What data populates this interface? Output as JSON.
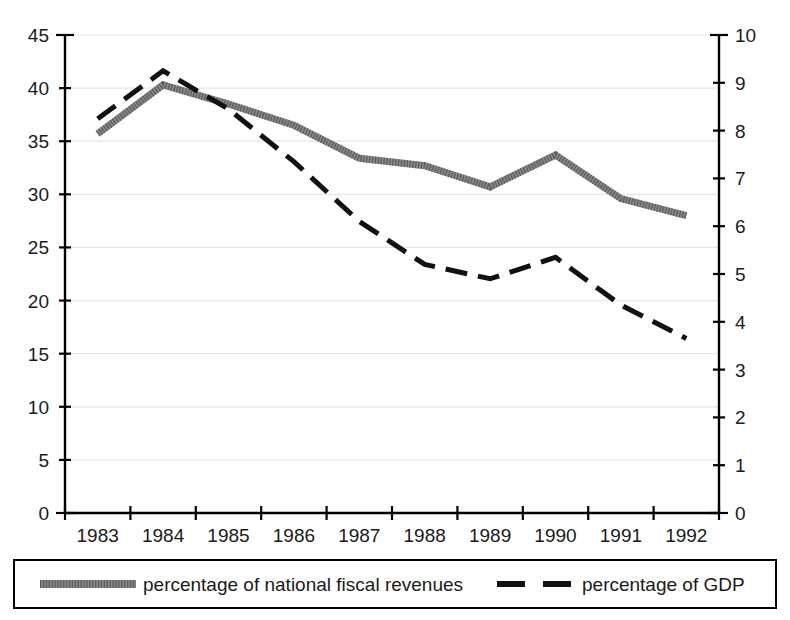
{
  "chart_data": {
    "type": "line",
    "title": "",
    "subtitle": "",
    "xlabel": "",
    "ylabel": "",
    "grid": true,
    "legend_position": "bottom",
    "categories": [
      "1983",
      "1984",
      "1985",
      "1986",
      "1987",
      "1988",
      "1989",
      "1990",
      "1991",
      "1992"
    ],
    "x_tick_labels": [
      "1983",
      "1984",
      "1985",
      "1986",
      "1987",
      "1988",
      "1989",
      "1990",
      "1991",
      "1992"
    ],
    "left_axis": {
      "label": "",
      "ylim": [
        0,
        45
      ],
      "tick_step": 5,
      "ticks": [
        0,
        5,
        10,
        15,
        20,
        25,
        30,
        35,
        40,
        45
      ],
      "tick_labels": [
        "0",
        "5",
        "10",
        "15",
        "20",
        "25",
        "30",
        "35",
        "40",
        "45"
      ]
    },
    "right_axis": {
      "label": "",
      "ylim": [
        0,
        10
      ],
      "tick_step": 1,
      "ticks": [
        0,
        1,
        2,
        3,
        4,
        5,
        6,
        7,
        8,
        9,
        10
      ],
      "tick_labels": [
        "0",
        "1",
        "2",
        "3",
        "4",
        "5",
        "6",
        "7",
        "8",
        "9",
        "10"
      ]
    },
    "series": [
      {
        "name": "percentage of national fiscal revenues",
        "axis": "left",
        "style": "solid-thick-gray",
        "color": "#8a8a8a",
        "values": [
          35.7,
          40.3,
          38.5,
          36.5,
          33.4,
          32.7,
          30.7,
          33.7,
          29.6,
          28.0
        ]
      },
      {
        "name": "percentage of GDP",
        "axis": "right",
        "style": "dashed-black",
        "color": "#111111",
        "values": [
          8.25,
          9.25,
          8.45,
          7.35,
          6.1,
          5.2,
          4.9,
          5.35,
          4.35,
          3.65
        ]
      }
    ]
  },
  "legend": {
    "items": [
      {
        "label": "percentage of national fiscal revenues",
        "swatch": "gray-thick-line-swatch",
        "color": "#8a8a8a"
      },
      {
        "label": "percentage of GDP",
        "swatch": "black-dashed-line-swatch",
        "color": "#111111"
      }
    ]
  },
  "colors": {
    "gray_series": "#8a8a8a",
    "black_series": "#111111",
    "axis": "#000000",
    "gridline": "#e6e6e6",
    "background": "#ffffff"
  }
}
